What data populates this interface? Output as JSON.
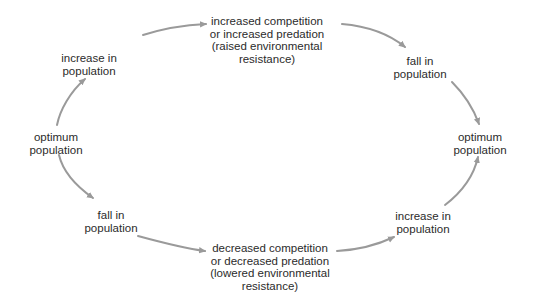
{
  "diagram": {
    "type": "cycle",
    "arrow_color": "#9a9a9a",
    "text_color": "#2b2b2b",
    "nodes": {
      "top": {
        "lines": [
          "increased competition",
          "or increased predation",
          "(raised environmental",
          "resistance)"
        ]
      },
      "top_left": {
        "lines": [
          "increase in",
          "population"
        ]
      },
      "left": {
        "lines": [
          "optimum",
          "population"
        ]
      },
      "bottom_left": {
        "lines": [
          "fall in",
          "population"
        ]
      },
      "bottom": {
        "lines": [
          "decreased competition",
          "or decreased predation",
          "(lowered environmental",
          "resistance)"
        ]
      },
      "top_right": {
        "lines": [
          "fall in",
          "population"
        ]
      },
      "right": {
        "lines": [
          "optimum",
          "population"
        ]
      },
      "bottom_right": {
        "lines": [
          "increase in",
          "population"
        ]
      }
    },
    "edges": [
      {
        "from": "left",
        "to": "top_left"
      },
      {
        "from": "top_left",
        "to": "top"
      },
      {
        "from": "top",
        "to": "top_right"
      },
      {
        "from": "top_right",
        "to": "right"
      },
      {
        "from": "left",
        "to": "bottom_left"
      },
      {
        "from": "bottom_left",
        "to": "bottom"
      },
      {
        "from": "bottom",
        "to": "bottom_right"
      },
      {
        "from": "bottom_right",
        "to": "right"
      }
    ]
  }
}
